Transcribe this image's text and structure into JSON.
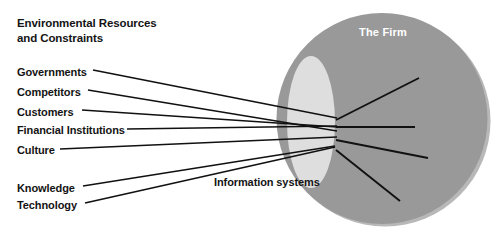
{
  "figure": {
    "title_lines": [
      "Environmental Resources",
      "and Constraints"
    ],
    "firm_label": "The Firm",
    "focal_label": "Information systems"
  },
  "inputs": [
    {
      "label": "Governments",
      "text_x": 17,
      "text_y": 66,
      "line_start_x": 93,
      "line_start_y": 70
    },
    {
      "label": "Competitors",
      "text_x": 17,
      "text_y": 86,
      "line_start_x": 88,
      "line_start_y": 90
    },
    {
      "label": "Customers",
      "text_x": 17,
      "text_y": 106,
      "line_start_x": 82,
      "line_start_y": 110
    },
    {
      "label": "Financial Institutions",
      "text_x": 17,
      "text_y": 124,
      "line_start_x": 127,
      "line_start_y": 129
    },
    {
      "label": "Culture",
      "text_x": 17,
      "text_y": 144,
      "line_start_x": 60,
      "line_start_y": 149
    },
    {
      "label": "Knowledge",
      "text_x": 17,
      "text_y": 182,
      "line_start_x": 83,
      "line_start_y": 186
    },
    {
      "label": "Technology",
      "text_x": 17,
      "text_y": 199,
      "line_start_x": 85,
      "line_start_y": 203
    }
  ],
  "focal_point": {
    "x": 335,
    "y": 131
  },
  "input_endpoints": [
    {
      "x": 337,
      "y": 118
    },
    {
      "x": 337,
      "y": 131
    },
    {
      "x": 337,
      "y": 127
    },
    {
      "x": 337,
      "y": 126
    },
    {
      "x": 337,
      "y": 137
    },
    {
      "x": 335,
      "y": 146
    },
    {
      "x": 335,
      "y": 147
    }
  ],
  "outputs": [
    {
      "from_x": 336,
      "from_y": 120,
      "to_x": 419,
      "to_y": 78
    },
    {
      "from_x": 336,
      "from_y": 127,
      "to_x": 415,
      "to_y": 127
    },
    {
      "from_x": 336,
      "from_y": 140,
      "to_x": 428,
      "to_y": 158
    },
    {
      "from_x": 336,
      "from_y": 150,
      "to_x": 400,
      "to_y": 201
    }
  ],
  "shapes": {
    "firm_circle": {
      "cx": 382,
      "cy": 118.5,
      "r": 105.5,
      "fill": "#999999"
    },
    "firm_shadow": {
      "cx": 385,
      "cy": 121,
      "r": 105.5,
      "fill": "#b3b3b3"
    },
    "focal_ellipse": {
      "cx": 311,
      "cy": 122,
      "rx": 24,
      "ry": 66,
      "fill": "#dedede"
    }
  },
  "colors": {
    "background": "#ffffff",
    "firm_fill": "#999999",
    "firm_shadow": "#b8b8b8",
    "focal_fill": "#dedede",
    "line": "#111111",
    "text": "#141414",
    "firm_text": "#ffffff"
  }
}
